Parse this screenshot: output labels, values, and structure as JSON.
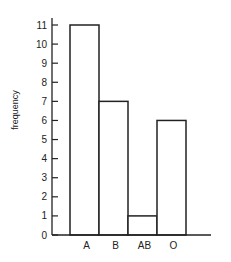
{
  "chart_data": {
    "type": "bar",
    "title": "",
    "xlabel": "",
    "ylabel": "frequency",
    "categories": [
      "A",
      "B",
      "AB",
      "O"
    ],
    "values": [
      11,
      7,
      1,
      6
    ],
    "ylim": [
      0,
      11
    ],
    "yticks": [
      0,
      1,
      2,
      3,
      4,
      5,
      6,
      7,
      8,
      9,
      10,
      11
    ],
    "grid": false,
    "legend": "none"
  }
}
